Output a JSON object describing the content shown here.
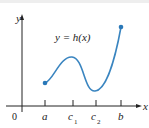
{
  "diagram": {
    "function_label": "y = h(x)",
    "y_axis_label": "y",
    "x_axis_label": "x",
    "origin_label": "0",
    "tick_labels": [
      {
        "main": "a",
        "sub": ""
      },
      {
        "main": "c",
        "sub": "1"
      },
      {
        "main": "c",
        "sub": "2"
      },
      {
        "main": "b",
        "sub": ""
      }
    ],
    "colors": {
      "curve": "#3a85c0",
      "axis": "#222222"
    }
  }
}
